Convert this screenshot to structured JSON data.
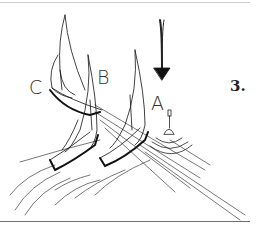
{
  "figure": {
    "number": "3.",
    "boats": [
      {
        "label": "A"
      },
      {
        "label": "B"
      },
      {
        "label": "C"
      }
    ],
    "wind_arrow": "wind-arrow-down",
    "mark": "buoy-mark",
    "colors": {
      "ink": "#111111",
      "background": "#ffffff"
    }
  }
}
